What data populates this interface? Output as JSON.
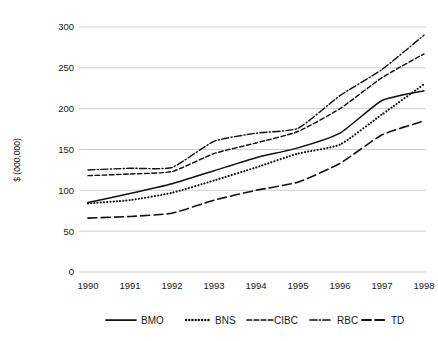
{
  "chart_data": {
    "type": "line",
    "title": "",
    "subtitle": "",
    "xlabel": "",
    "ylabel": "$ (000,000)",
    "x": [
      1990,
      1991,
      1992,
      1993,
      1994,
      1995,
      1996,
      1997,
      1998
    ],
    "categories": [
      "1990",
      "1991",
      "1992",
      "1993",
      "1994",
      "1995",
      "1996",
      "1997",
      "1998"
    ],
    "xlim": [
      1990,
      1998
    ],
    "ylim": [
      0,
      300
    ],
    "yticks": [
      0,
      50,
      100,
      150,
      200,
      250,
      300
    ],
    "ytick_labels": [
      "0",
      "50",
      "100",
      "150",
      "200",
      "250",
      "300"
    ],
    "grid": "horizontal",
    "legend_position": "bottom",
    "series": [
      {
        "name": "BMO",
        "style": "solid",
        "color": "#111111",
        "values": [
          85,
          96,
          108,
          124,
          140,
          152,
          170,
          210,
          222
        ]
      },
      {
        "name": "BNS",
        "style": "dotted",
        "color": "#111111",
        "values": [
          84,
          88,
          97,
          112,
          128,
          145,
          156,
          193,
          230
        ]
      },
      {
        "name": "CIBC",
        "style": "dashed",
        "color": "#111111",
        "values": [
          118,
          120,
          123,
          145,
          158,
          172,
          200,
          238,
          267
        ]
      },
      {
        "name": "RBC",
        "style": "dash-dot",
        "color": "#111111",
        "values": [
          125,
          127,
          128,
          160,
          170,
          176,
          216,
          248,
          290
        ]
      },
      {
        "name": "TD",
        "style": "long-dash",
        "color": "#111111",
        "values": [
          66,
          68,
          72,
          88,
          100,
          110,
          133,
          168,
          185
        ]
      }
    ]
  },
  "legend": {
    "entries": [
      {
        "label": "BMO",
        "style": "solid"
      },
      {
        "label": "BNS",
        "style": "dotted"
      },
      {
        "label": "CIBC",
        "style": "dashed"
      },
      {
        "label": "RBC",
        "style": "dash-dot"
      },
      {
        "label": "TD",
        "style": "long-dash"
      }
    ]
  },
  "colors": {
    "ink": "#111111",
    "gridline": "#c9c9c9",
    "background": "#ffffff"
  }
}
